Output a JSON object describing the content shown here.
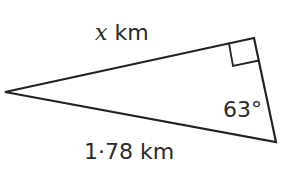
{
  "diagram": {
    "type": "right-triangle",
    "labels": {
      "top_side_variable": "x",
      "top_side_unit": " km",
      "angle": "63°",
      "bottom_side": "1·78 km"
    },
    "vertices": {
      "left": [
        5,
        92
      ],
      "right_angle": [
        254,
        38
      ],
      "bottom_right": [
        276,
        142
      ]
    },
    "stroke_color": "#222222"
  }
}
